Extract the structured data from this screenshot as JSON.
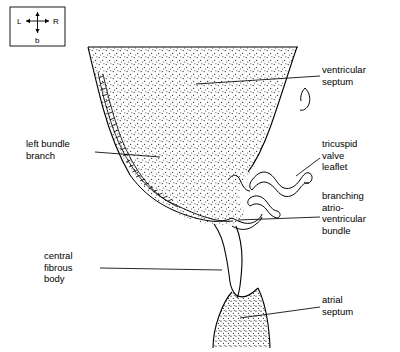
{
  "figure": {
    "title_present": false,
    "background_color": "#ffffff",
    "line_color": "#000000",
    "stipple_color": "#000000"
  },
  "compass": {
    "name": "orientation-compass",
    "left_label": "L",
    "right_label": "R",
    "bottom_label": "b",
    "top_label": ""
  },
  "labels": [
    {
      "id": "ventricular-septum",
      "text": "ventricular\nseptum",
      "x": 325,
      "y": 70
    },
    {
      "id": "left-bundle-branch",
      "text": "left bundle\nbranch",
      "x": 28,
      "y": 142
    },
    {
      "id": "tricuspid-valve-leaflet",
      "text": "tricuspid\nvalve\nleaflet",
      "x": 325,
      "y": 143
    },
    {
      "id": "branching-atrio-ventricular-bundle",
      "text": "branching\natrio-\nventricular\nbundle",
      "x": 325,
      "y": 194
    },
    {
      "id": "central-fibrous-body",
      "text": "central\nfibrous\nbody",
      "x": 45,
      "y": 252
    },
    {
      "id": "atrial-septum",
      "text": "atrial\nseptum",
      "x": 325,
      "y": 297
    }
  ],
  "leader_lines": [
    {
      "from": "ventricular-septum",
      "to_x": 196,
      "to_y": 84
    },
    {
      "from": "left-bundle-branch",
      "to_x": 160,
      "to_y": 157
    },
    {
      "from": "tricuspid-valve-leaflet",
      "to_x": 292,
      "to_y": 178
    },
    {
      "from": "branching-atrio-ventricular-bundle",
      "to_x": 235,
      "to_y": 222
    },
    {
      "from": "central-fibrous-body",
      "to_x": 225,
      "to_y": 270
    },
    {
      "from": "atrial-septum",
      "to_x": 240,
      "to_y": 318
    }
  ]
}
